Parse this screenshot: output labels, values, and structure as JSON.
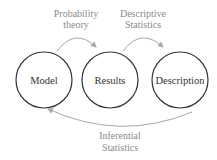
{
  "diagram": {
    "nodes": [
      {
        "id": "model",
        "label": "Model",
        "cx": 44,
        "cy": 80,
        "r": 28
      },
      {
        "id": "results",
        "label": "Results",
        "cx": 110,
        "cy": 80,
        "r": 28
      },
      {
        "id": "description",
        "label": "Description",
        "cx": 180,
        "cy": 80,
        "r": 28
      }
    ],
    "edges": [
      {
        "from": "model",
        "to": "results",
        "label_line1": "Probability",
        "label_line2": "theory"
      },
      {
        "from": "results",
        "to": "description",
        "label_line1": "Descriptive",
        "label_line2": "Statistics"
      },
      {
        "from": "description",
        "to": "model",
        "label_line1": "Inferential",
        "label_line2": "Statistics"
      }
    ],
    "colors": {
      "node_stroke": "#333333",
      "node_text": "#333333",
      "edge_stroke": "#a8a8a8",
      "edge_text": "#8a8a8a",
      "background": "#ffffff"
    }
  }
}
